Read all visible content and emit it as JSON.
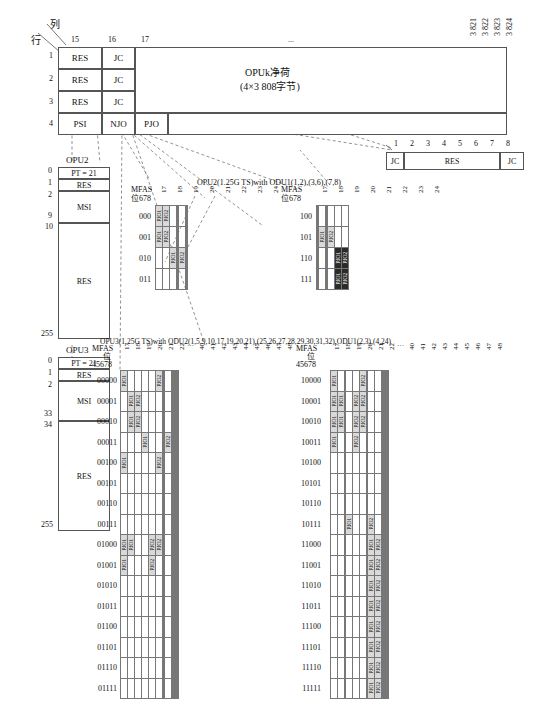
{
  "frame": {
    "axis_row_label": "行",
    "axis_col_label": "列",
    "col_headers": [
      "15",
      "16",
      "17"
    ],
    "col_ellipsis": "...",
    "col_tail": [
      "3 821",
      "3 822",
      "3 823",
      "3 824"
    ],
    "rows": [
      {
        "num": "1",
        "c15": "RES",
        "c16": "JC"
      },
      {
        "num": "2",
        "c15": "RES",
        "c16": "JC"
      },
      {
        "num": "3",
        "c15": "RES",
        "c16": "JC"
      },
      {
        "num": "4",
        "c15": "PSI",
        "c16": "NJO",
        "c17": "PJO"
      }
    ],
    "payload_title": "OPUk净荷",
    "payload_sub": "(4×3 808字节)"
  },
  "jc_detail": {
    "bits": [
      "1",
      "2",
      "3",
      "4",
      "5",
      "6",
      "7",
      "8"
    ],
    "cells": [
      "JC",
      "RES",
      "JC"
    ]
  },
  "opu2_psi": {
    "title": "OPU2",
    "rows": [
      {
        "index": "0",
        "label": "PT = 21"
      },
      {
        "index": "1",
        "label": "RES"
      },
      {
        "index": "2",
        "label": "MSI",
        "end": "9"
      },
      {
        "index": "10",
        "label": "RES",
        "end": "255"
      }
    ]
  },
  "opu3_psi": {
    "title": "OPU3",
    "rows": [
      {
        "index": "0",
        "label": "PT = 21"
      },
      {
        "index": "1",
        "label": "RES"
      },
      {
        "index": "2",
        "label": "MSI",
        "end": "33"
      },
      {
        "index": "34",
        "label": "RES",
        "end": "255"
      }
    ]
  },
  "opu2_section": {
    "title": "OPU2(1.25G TS)with ODU1(1,2),(3,6),(7,8)",
    "mfas_label": "MFAS",
    "mfas_bits": "位678",
    "columns": [
      "17",
      "18",
      "19",
      "20",
      "21",
      "22",
      "23",
      "24"
    ],
    "left_rows": [
      "000",
      "001",
      "010",
      "011"
    ],
    "right_rows": [
      "100",
      "101",
      "110",
      "111"
    ],
    "left_cells": [
      {
        "row": "000",
        "col": "17",
        "text": "PJO1",
        "style": "shade"
      },
      {
        "row": "000",
        "col": "18",
        "text": "PJO2",
        "style": "shade"
      },
      {
        "row": "001",
        "col": "17",
        "text": "PJO1",
        "style": "shade"
      },
      {
        "row": "001",
        "col": "18",
        "text": "PJO2",
        "style": "shade"
      },
      {
        "row": "010",
        "col": "19",
        "text": "PJO1",
        "style": "shade"
      },
      {
        "row": "010",
        "col": "22",
        "text": "PJO2",
        "style": "shade"
      }
    ],
    "right_cells": [
      {
        "row": "101",
        "col": "19",
        "text": "PJO1",
        "style": "shade"
      },
      {
        "row": "101",
        "col": "22",
        "text": "PJO2",
        "style": "shade"
      },
      {
        "row": "110",
        "col": "23",
        "text": "PJO1",
        "style": "dark"
      },
      {
        "row": "110",
        "col": "24",
        "text": "PJO2",
        "style": "dark"
      },
      {
        "row": "111",
        "col": "23",
        "text": "PJO1",
        "style": "dark"
      },
      {
        "row": "111",
        "col": "24",
        "text": "PJO2",
        "style": "dark"
      }
    ]
  },
  "opu3_section": {
    "title": "OPU3(1.25G TS)with ODU2(1,5,9,10,17,19,20,21),(25,26,27,28,29,30,31,32),ODU1(2,3),(4,24)",
    "mfas_label": "MFAS",
    "mfas_bits_left": "位\n45678",
    "mfas_bits_right": "位\n45678",
    "columns_head": [
      "17",
      "18",
      "19",
      "20",
      "21",
      "22"
    ],
    "columns_ellipsis": "...",
    "columns_tail": [
      "40",
      "41",
      "42",
      "43",
      "44",
      "45",
      "46",
      "47",
      "48"
    ],
    "left_rows": [
      "00000",
      "00001",
      "00010",
      "00011",
      "00100",
      "00101",
      "00110",
      "00111",
      "01000",
      "01001",
      "01010",
      "01011",
      "01100",
      "01101",
      "01110",
      "01111"
    ],
    "right_rows": [
      "10000",
      "10001",
      "10010",
      "10011",
      "10100",
      "10101",
      "10110",
      "10111",
      "11000",
      "11001",
      "11010",
      "11011",
      "11100",
      "11101",
      "11110",
      "11111"
    ],
    "left_cells": [
      {
        "row": "00000",
        "col": "17",
        "text": "PJO1",
        "style": "shade"
      },
      {
        "row": "00000",
        "col": "22",
        "text": "PJO2",
        "style": "shade"
      },
      {
        "row": "00001",
        "col": "18",
        "text": "PJO1",
        "style": "shade"
      },
      {
        "row": "00001",
        "col": "19",
        "text": "PJO2",
        "style": "shade"
      },
      {
        "row": "00010",
        "col": "18",
        "text": "PJO1",
        "style": "shade"
      },
      {
        "row": "00010",
        "col": "19",
        "text": "PJO2",
        "style": "shade"
      },
      {
        "row": "00011",
        "col": "20",
        "text": "PJO1",
        "style": "shade"
      },
      {
        "row": "00011",
        "col": "41",
        "text": "PJO2",
        "style": "shade"
      },
      {
        "row": "00100",
        "col": "17",
        "text": "PJO1",
        "style": "shade"
      },
      {
        "row": "00100",
        "col": "22",
        "text": "PJO2",
        "style": "shade"
      },
      {
        "row": "01000",
        "col": "17",
        "text": "PJO1",
        "style": "shade"
      },
      {
        "row": "01000",
        "col": "18",
        "text": "PJO1",
        "style": "shade"
      },
      {
        "row": "01000",
        "col": "21",
        "text": "PJO2",
        "style": "shade"
      },
      {
        "row": "01000",
        "col": "22",
        "text": "PJO2",
        "style": "shade"
      },
      {
        "row": "01001",
        "col": "17",
        "text": "PJO1",
        "style": "shade"
      },
      {
        "row": "01001",
        "col": "21",
        "text": "PJO2",
        "style": "shade"
      }
    ],
    "right_cells": [
      {
        "row": "10000",
        "col": "17",
        "text": "PJO1",
        "style": "shade"
      },
      {
        "row": "10000",
        "col": "22",
        "text": "PJO2",
        "style": "shade"
      },
      {
        "row": "10001",
        "col": "17",
        "text": "PJO1",
        "style": "shade"
      },
      {
        "row": "10001",
        "col": "18",
        "text": "PJO1",
        "style": "shade"
      },
      {
        "row": "10001",
        "col": "21",
        "text": "PJO2",
        "style": "shade"
      },
      {
        "row": "10001",
        "col": "22",
        "text": "PJO2",
        "style": "shade"
      },
      {
        "row": "10010",
        "col": "17",
        "text": "PJO1",
        "style": "shade"
      },
      {
        "row": "10010",
        "col": "18",
        "text": "PJO1",
        "style": "shade"
      },
      {
        "row": "10010",
        "col": "21",
        "text": "PJO2",
        "style": "shade"
      },
      {
        "row": "10010",
        "col": "22",
        "text": "PJO2",
        "style": "shade"
      },
      {
        "row": "10011",
        "col": "17",
        "text": "PJO1",
        "style": "shade"
      },
      {
        "row": "10011",
        "col": "21",
        "text": "PJO2",
        "style": "shade"
      },
      {
        "row": "10111",
        "col": "20",
        "text": "PJO1",
        "style": "shade"
      },
      {
        "row": "10111",
        "col": "40",
        "text": "PJO2",
        "style": "shade"
      },
      {
        "row": "11000",
        "col": "40",
        "text": "PJO1",
        "style": "shade"
      },
      {
        "row": "11000",
        "col": "41",
        "text": "PJO2",
        "style": "shade"
      },
      {
        "row": "11001",
        "col": "40",
        "text": "PJO1",
        "style": "shade"
      },
      {
        "row": "11001",
        "col": "41",
        "text": "PJO2",
        "style": "shade"
      },
      {
        "row": "11010",
        "col": "40",
        "text": "PJO1",
        "style": "shade"
      },
      {
        "row": "11010",
        "col": "41",
        "text": "PJO2",
        "style": "shade"
      },
      {
        "row": "11011",
        "col": "40",
        "text": "PJO1",
        "style": "shade"
      },
      {
        "row": "11011",
        "col": "41",
        "text": "PJO2",
        "style": "shade"
      },
      {
        "row": "11100",
        "col": "40",
        "text": "PJO1",
        "style": "shade"
      },
      {
        "row": "11100",
        "col": "41",
        "text": "PJO2",
        "style": "shade"
      },
      {
        "row": "11101",
        "col": "40",
        "text": "PJO1",
        "style": "shade"
      },
      {
        "row": "11101",
        "col": "41",
        "text": "PJO2",
        "style": "shade"
      },
      {
        "row": "11110",
        "col": "40",
        "text": "PJO1",
        "style": "shade"
      },
      {
        "row": "11110",
        "col": "41",
        "text": "PJO2",
        "style": "shade"
      },
      {
        "row": "11111",
        "col": "40",
        "text": "PJO1",
        "style": "shade"
      },
      {
        "row": "11111",
        "col": "41",
        "text": "PJO2",
        "style": "shade"
      }
    ]
  },
  "colors": {
    "line": "#555555",
    "shade": "#d9d9d9",
    "dark": "#2b2b2b",
    "dashed": "#777777"
  }
}
